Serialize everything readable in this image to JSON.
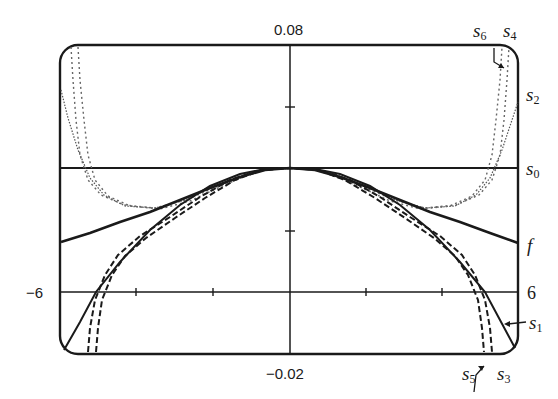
{
  "chart_data": {
    "type": "line",
    "title": "",
    "window": {
      "xmin": -6,
      "xmax": 6,
      "ymin": -0.02,
      "ymax": 0.08
    },
    "xlabel": "",
    "ylabel": "",
    "tick_labels": {
      "x_left": "-6",
      "x_right": "6",
      "y_top": "0.08",
      "y_bottom": "-0.02"
    },
    "grid": false,
    "legend": "inline labels at right edge",
    "series": [
      {
        "name": "f",
        "style": "solid-thick",
        "label": "f"
      },
      {
        "name": "s0",
        "style": "solid-thin",
        "label": "s0"
      },
      {
        "name": "s1",
        "style": "solid",
        "label": "s1"
      },
      {
        "name": "s2",
        "style": "dotted-light",
        "label": "s2"
      },
      {
        "name": "s3",
        "style": "dashed",
        "label": "s3"
      },
      {
        "name": "s4",
        "style": "dotted-light",
        "label": "s4"
      },
      {
        "name": "s5",
        "style": "dashed",
        "label": "s5"
      },
      {
        "name": "s6",
        "style": "dotted-light",
        "label": "s6"
      }
    ]
  },
  "labels": {
    "y_top": "0.08",
    "y_bottom": "−0.02",
    "x_left": "−6",
    "x_right": "6",
    "s6": {
      "base": "s",
      "sub": "6"
    },
    "s4": {
      "base": "s",
      "sub": "4"
    },
    "s2": {
      "base": "s",
      "sub": "2"
    },
    "s0": {
      "base": "s",
      "sub": "0"
    },
    "f": "f",
    "s1": {
      "base": "s",
      "sub": "1"
    },
    "s5": {
      "base": "s",
      "sub": "5"
    },
    "s3": {
      "base": "s",
      "sub": "3"
    }
  },
  "geometry": {
    "frame": {
      "x": 60,
      "y": 45,
      "w": 458,
      "h": 309,
      "r": 18
    },
    "yaxis_x": 290,
    "s0_line_y": 168,
    "x6_line_y": 292,
    "xticks": [
      136,
      213,
      366,
      442
    ],
    "yticks": [
      107,
      231
    ]
  },
  "curves": {
    "f": "61,242 90,233 120,222 150,212 180,200 210,188 240,177 265,170 290,168 315,170 340,177 370,188 400,200 430,212 460,222 490,233 518,243",
    "s1": "64,350 80,322 96,292 120,262 150,230 180,205 210,186 240,174 265,169 290,168 315,169 340,174 370,186 400,205 430,230 460,262 485,292 500,320 515,348",
    "s3a": "88,352 90,328 95,300 105,275 118,255 140,236 170,217 200,197 230,180 260,170 290,168 320,170 350,180 380,197 410,217 440,236 462,255 475,275 485,300 490,328 492,352",
    "s3b": "96,352 98,328 102,300 112,275 125,256 146,238 175,218 205,198 235,180 262,170 290,168 318,170 345,180 375,198 405,218 434,238 455,256 468,275 478,300 482,328 484,352",
    "s2": "61,90 68,118 78,150 90,178 104,195 125,206 155,208 185,200 215,186 245,174 268,169 290,168 312,169 335,174 365,186 395,200 425,208 455,206 476,195 490,178 502,150 512,120 518,102",
    "s4": "78,47 80,80 84,120 88,155 95,180 108,196 130,206 160,209 190,201 220,187 250,174 270,169 290,168 310,169 330,174 360,187 390,201 420,209 450,206 472,196 485,180 492,155 496,120 500,80 502,47",
    "s6": "71,47 73,80 76,120 80,155 88,180 101,195 124,205 155,208 186,200 218,186 248,174 270,169 290,168 310,169 332,174 362,186 394,200 425,208 456,205 479,195 492,180 500,155 504,120 507,80 509,47"
  },
  "annotations": {
    "s6_pointer": "494,48 494,62 504,68",
    "s5_pointer": "474,392 476,375 484,366"
  }
}
